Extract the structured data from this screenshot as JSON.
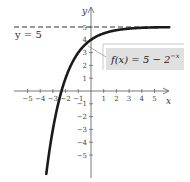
{
  "chart_data": {
    "type": "line",
    "title": "",
    "xlabel": "x",
    "ylabel": "y",
    "xlim": [
      -5.5,
      6.3
    ],
    "ylim": [
      -6.5,
      6
    ],
    "x_ticks": [
      -5,
      -4,
      -3,
      -2,
      -1,
      1,
      2,
      3,
      4,
      5
    ],
    "x_tick_labels": [
      "−5",
      "−4",
      "−3",
      "−2",
      "−1",
      "1",
      "2",
      "3",
      "4",
      "5"
    ],
    "y_ticks": [
      -5,
      -4,
      -3,
      -2,
      -1,
      1,
      2,
      3,
      4,
      5
    ],
    "y_tick_labels": [
      "−5",
      "−4",
      "−3",
      "−2",
      "−1",
      "1",
      "2",
      "3",
      "4",
      "5"
    ],
    "grid": false,
    "series": [
      {
        "name": "f(x) = 5 − 2^(−x)",
        "function": "5 - 2^(-x)",
        "x": [
          -3.5,
          -3,
          -2.5,
          -2,
          -1.5,
          -1,
          -0.5,
          0,
          0.5,
          1,
          2,
          3,
          4,
          5,
          6
        ],
        "values": [
          -6.31,
          -3,
          -0.66,
          1,
          2.17,
          3,
          3.59,
          4,
          4.29,
          4.5,
          4.75,
          4.88,
          4.94,
          4.97,
          4.98
        ]
      }
    ],
    "asymptote": {
      "type": "horizontal",
      "y": 5,
      "style": "dashed"
    },
    "annotations": [
      {
        "text": "y = 5",
        "position": "left, below asymptote"
      },
      {
        "text": "f(x) = 5 − 2",
        "superscript": "−x",
        "position": "boxed label, right of y-axis, with leader line to curve"
      }
    ]
  },
  "labels": {
    "x_axis": "x",
    "y_axis": "y",
    "asymptote": "y = 5",
    "function_main": "f(x) = 5 − 2",
    "function_sup": "−x"
  },
  "colors": {
    "curve": "#1a1a1a",
    "axis": "#555555",
    "label_box": "#e0e0e0",
    "asymptote": "#333333"
  }
}
